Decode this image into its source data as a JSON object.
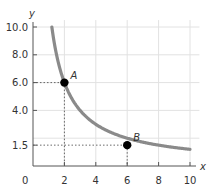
{
  "chart_data": {
    "type": "line",
    "title": "",
    "xlabel": "x",
    "ylabel": "y",
    "xlim": [
      0,
      10
    ],
    "ylim": [
      0,
      10
    ],
    "x_ticks": [
      "0",
      "2",
      "4",
      "6",
      "8",
      "10"
    ],
    "y_ticks": [
      "1.5",
      "4.0",
      "6.0",
      "8.0",
      "10.0"
    ],
    "grid": true,
    "series": [
      {
        "name": "curve",
        "function": "y = 12 / x",
        "x": [
          1.2,
          1.5,
          2,
          3,
          4,
          5,
          6,
          7,
          8,
          9,
          10
        ],
        "y": [
          10.0,
          8.0,
          6.0,
          4.0,
          3.0,
          2.4,
          2.0,
          1.71,
          1.5,
          1.33,
          1.2
        ],
        "color": "#808080"
      }
    ],
    "points": [
      {
        "label": "A",
        "x": 2,
        "y": 6.0
      },
      {
        "label": "B",
        "x": 6,
        "y": 1.5
      }
    ]
  },
  "labels": {
    "x_axis": "x",
    "y_axis": "y",
    "origin": "0",
    "point_a": "A",
    "point_b": "B"
  }
}
